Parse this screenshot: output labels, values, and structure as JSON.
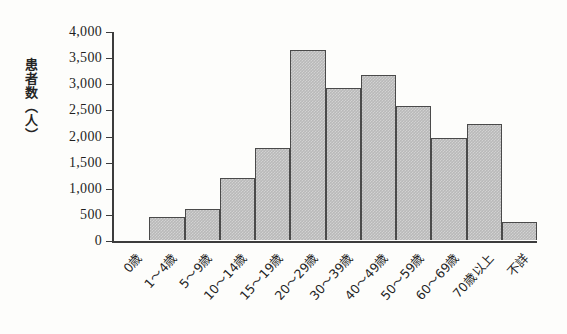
{
  "chart_data": {
    "type": "bar",
    "title": "",
    "subtitle": "",
    "xlabel": "",
    "ylabel": "患者数（人）",
    "ylim": [
      0,
      4000
    ],
    "grid": false,
    "legend": false,
    "categories": [
      "0歳",
      "1〜4歳",
      "5〜9歳",
      "10〜14歳",
      "15〜19歳",
      "20〜29歳",
      "30〜39歳",
      "40〜49歳",
      "50〜59歳",
      "60〜69歳",
      "70歳以上",
      "不詳"
    ],
    "values": [
      0,
      450,
      590,
      1180,
      1770,
      3630,
      2900,
      3160,
      2570,
      1960,
      2220,
      340
    ],
    "ytick_values": [
      0,
      500,
      1000,
      1500,
      2000,
      2500,
      3000,
      3500,
      4000
    ],
    "ytick_labels": [
      "0",
      "500",
      "1,000",
      "1,500",
      "2,000",
      "2,500",
      "3,000",
      "3,500",
      "4,000"
    ],
    "bar_fill_color": "#b9b9b9",
    "bar_edge_color": "#4a4a4a",
    "axis_color": "#3c3c3c",
    "background_color": "#fdfdfb"
  }
}
